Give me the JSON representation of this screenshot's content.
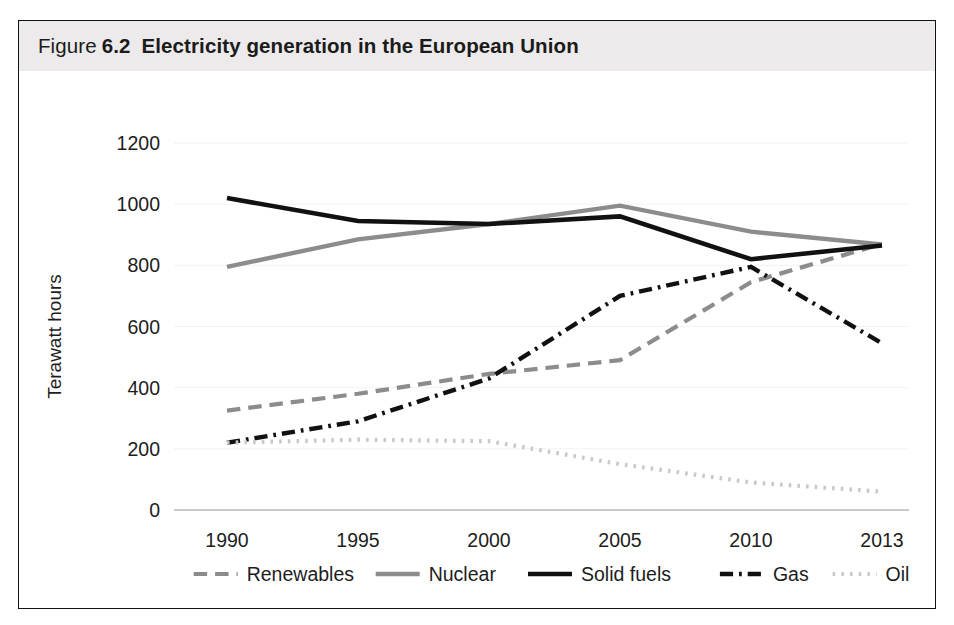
{
  "figure": {
    "label_word": "Figure",
    "number": "6.2",
    "caption": "Electricity generation in the European Union"
  },
  "axes": {
    "ylabel": "Terawatt hours",
    "yticks": [
      "0",
      "200",
      "400",
      "600",
      "800",
      "1000",
      "1200"
    ],
    "xticks": [
      "1990",
      "1995",
      "2000",
      "2005",
      "2010",
      "2013"
    ]
  },
  "legend": {
    "items": [
      {
        "label": "Renewables",
        "style": "dashed",
        "color": "#8c8c8c"
      },
      {
        "label": "Nuclear",
        "style": "solid",
        "color": "#8c8c8c"
      },
      {
        "label": "Solid fuels",
        "style": "solid",
        "color": "#111111"
      },
      {
        "label": "Gas",
        "style": "dash-dot",
        "color": "#111111"
      },
      {
        "label": "Oil",
        "style": "dotted",
        "color": "#c9c9c9"
      }
    ]
  },
  "chart_data": {
    "type": "line",
    "title": "Electricity generation in the European Union",
    "xlabel": "",
    "ylabel": "Terawatt hours",
    "categories": [
      "1990",
      "1995",
      "2000",
      "2005",
      "2010",
      "2013"
    ],
    "ylim": [
      0,
      1200
    ],
    "ytick_step": 200,
    "grid": true,
    "legend_position": "bottom",
    "series": [
      {
        "name": "Renewables",
        "values": [
          325,
          380,
          445,
          490,
          745,
          870
        ],
        "color": "#8c8c8c",
        "style": "dashed",
        "width": 4.2
      },
      {
        "name": "Nuclear",
        "values": [
          795,
          885,
          935,
          995,
          910,
          868
        ],
        "color": "#8c8c8c",
        "style": "solid",
        "width": 4.4
      },
      {
        "name": "Solid fuels",
        "values": [
          1020,
          945,
          935,
          960,
          820,
          865
        ],
        "color": "#111111",
        "style": "solid",
        "width": 4.6
      },
      {
        "name": "Gas",
        "values": [
          220,
          290,
          430,
          700,
          795,
          545
        ],
        "color": "#111111",
        "style": "dash-dot",
        "width": 4.4
      },
      {
        "name": "Oil",
        "values": [
          220,
          230,
          225,
          150,
          90,
          60
        ],
        "color": "#c9c9c9",
        "style": "dotted",
        "width": 4.2
      }
    ]
  }
}
